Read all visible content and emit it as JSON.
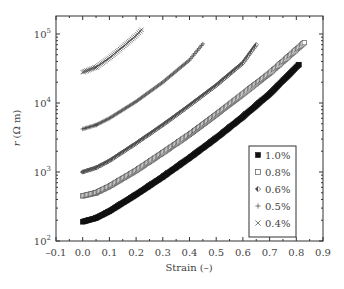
{
  "chart_data": {
    "type": "scatter",
    "title": "",
    "xlabel": "Strain (–)",
    "ylabel": "r (Ω m)",
    "xlim": [
      -0.1,
      0.9
    ],
    "ylim": [
      100,
      190000
    ],
    "yscale": "log",
    "x_ticks": [
      "–0.1",
      "0.0",
      "0.1",
      "0.2",
      "0.3",
      "0.4",
      "0.5",
      "0.6",
      "0.7",
      "0.8",
      "0.9"
    ],
    "y_ticks": [
      {
        "value": 100,
        "base": "10",
        "exp": "2"
      },
      {
        "value": 1000,
        "base": "10",
        "exp": "3"
      },
      {
        "value": 10000,
        "base": "10",
        "exp": "4"
      },
      {
        "value": 100000,
        "base": "10",
        "exp": "5"
      }
    ],
    "grid": false,
    "legend_position": "lower right (inside)",
    "series": [
      {
        "name": "1.0%",
        "marker": "filled-square",
        "x": [
          0.0,
          0.05,
          0.1,
          0.2,
          0.3,
          0.4,
          0.5,
          0.6,
          0.7,
          0.81
        ],
        "y": [
          190,
          215,
          270,
          470,
          850,
          1600,
          3100,
          6300,
          13500,
          36000
        ]
      },
      {
        "name": "0.8%",
        "marker": "open-square",
        "x": [
          0.0,
          0.05,
          0.1,
          0.2,
          0.3,
          0.4,
          0.5,
          0.6,
          0.7,
          0.83
        ],
        "y": [
          450,
          500,
          620,
          1050,
          1900,
          3500,
          6800,
          13500,
          27000,
          75000
        ]
      },
      {
        "name": "0.6%",
        "marker": "half-filled-diamond",
        "x": [
          0.0,
          0.05,
          0.1,
          0.2,
          0.3,
          0.4,
          0.5,
          0.6,
          0.65
        ],
        "y": [
          1000,
          1150,
          1450,
          2600,
          4800,
          9200,
          18000,
          38000,
          70000
        ]
      },
      {
        "name": "0.5%",
        "marker": "plus",
        "x": [
          0.0,
          0.05,
          0.1,
          0.2,
          0.3,
          0.4,
          0.45
        ],
        "y": [
          4200,
          4800,
          6000,
          10500,
          20000,
          42000,
          72000
        ]
      },
      {
        "name": "0.4%",
        "marker": "cross",
        "x": [
          0.0,
          0.05,
          0.1,
          0.15,
          0.2,
          0.22
        ],
        "y": [
          28000,
          33000,
          45000,
          65000,
          95000,
          115000
        ]
      }
    ]
  },
  "legend": {
    "items": [
      {
        "symbol": "■",
        "label": "1.0%"
      },
      {
        "symbol": "□",
        "label": "0.8%"
      },
      {
        "symbol": "◆",
        "label": "0.6%"
      },
      {
        "symbol": "+",
        "label": "0.5%"
      },
      {
        "symbol": "×",
        "label": "0.4%"
      }
    ]
  },
  "axes": {
    "xlabel": "Strain (–)",
    "ylabel_italic": "r",
    "ylabel_unit": " (Ω m)"
  }
}
